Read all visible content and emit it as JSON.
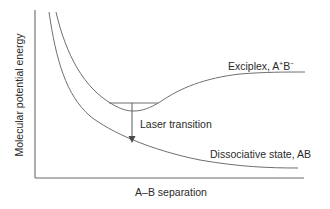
{
  "diagram": {
    "type": "potential-energy-curves",
    "axes": {
      "y_label": "Molecular potential energy",
      "x_label": "A–B separation"
    },
    "curves": [
      {
        "name": "Exciplex",
        "label_text": "Exciplex, A",
        "label_sup1": "+",
        "label_mid": "B",
        "label_sup2": "−",
        "shape": "bound potential well"
      },
      {
        "name": "Dissociative state",
        "label_text": "Dissociative state, AB",
        "shape": "repulsive, monotonically decreasing"
      }
    ],
    "transition": {
      "label": "Laser transition",
      "direction": "down from exciplex vibrational level to dissociative state"
    },
    "colors": {
      "line": "#6f6f6f",
      "text": "#2a2a2a",
      "background": "#ffffff"
    }
  }
}
